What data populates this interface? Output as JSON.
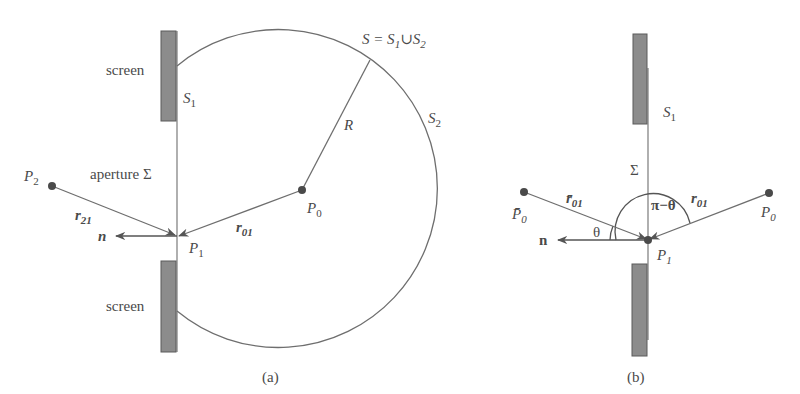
{
  "panel_a": {
    "caption": "(a)",
    "screen_top_label": "screen",
    "screen_bottom_label": "screen",
    "aperture_label": "aperture Σ",
    "s1_label": "S",
    "s1_sub": "1",
    "s2_label": "S",
    "s2_sub": "2",
    "surface_eq": {
      "s": "S = S",
      "sub1": "1",
      "cup": "∪S",
      "sub2": "2"
    },
    "radius_label": "R",
    "p0": {
      "label": "P",
      "sub": "0"
    },
    "p1": {
      "label": "P",
      "sub": "1"
    },
    "p2": {
      "label": "P",
      "sub": "2"
    },
    "r01": {
      "label": "r",
      "sub": "01"
    },
    "r21": {
      "label": "r",
      "sub": "21"
    },
    "normal_label": "n"
  },
  "panel_b": {
    "caption": "(b)",
    "s1_label": "S",
    "s1_sub": "1",
    "sigma_label": "Σ",
    "p0": {
      "label": "P",
      "sub": "0"
    },
    "p0_bar": {
      "label": "P̄",
      "sub": "0"
    },
    "p1": {
      "label": "P",
      "sub": "1"
    },
    "r01": {
      "label": "r",
      "sub": "01"
    },
    "r01_bar": {
      "label": "r̄",
      "sub": "01"
    },
    "theta_label": "θ",
    "pi_minus_theta_label": "π−θ",
    "normal_label": "n"
  },
  "colors": {
    "line": "#6e6e6e",
    "screen_fill": "#8c8c8c",
    "screen_stroke": "#5a5a5a",
    "point": "#4a4a4a"
  }
}
